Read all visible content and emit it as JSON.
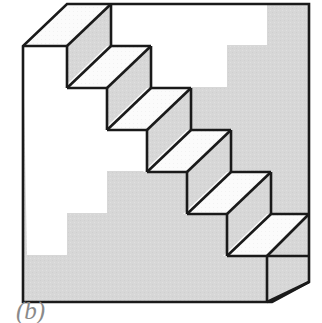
{
  "figure": {
    "name": "schroeder-staircase",
    "caption": "(b)",
    "caption_style": "italic-serif",
    "step_count": 6,
    "colors": {
      "background": "#ffffff",
      "body_gray": "#d6d6d6",
      "tread_white": "#fbfbfb",
      "outline": "#1a1a1a",
      "caption_gray": "#8a8a8a"
    },
    "geometry": {
      "frame_top_y": 3,
      "frame_right_x": 309,
      "frame_left_x": 23,
      "frame_left_top_y": 46,
      "frame_bottom_y": 303,
      "bottom_corner_x": 272,
      "right_bottom_y": 283,
      "step_dx": 40,
      "step_dy": 42,
      "depth_dx": 44,
      "depth_dy": -42,
      "stroke_width": 2.6
    },
    "faces": {
      "gray_body_label": "gray-body-face",
      "tread_label": "white-tread-face",
      "riser_label": "gray-riser-face",
      "right_side_label": "gray-right-side-face"
    }
  }
}
